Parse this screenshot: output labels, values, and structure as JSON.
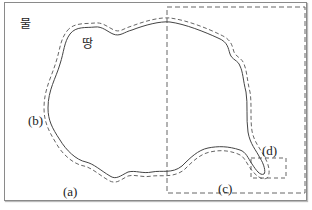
{
  "labels": {
    "water": "물",
    "land": "땅",
    "a": "(a)",
    "b": "(b)",
    "c": "(c)",
    "d": "(d)"
  },
  "colors": {
    "line": "#444444",
    "dash": "#555555",
    "frame": "#8a8a8a"
  }
}
